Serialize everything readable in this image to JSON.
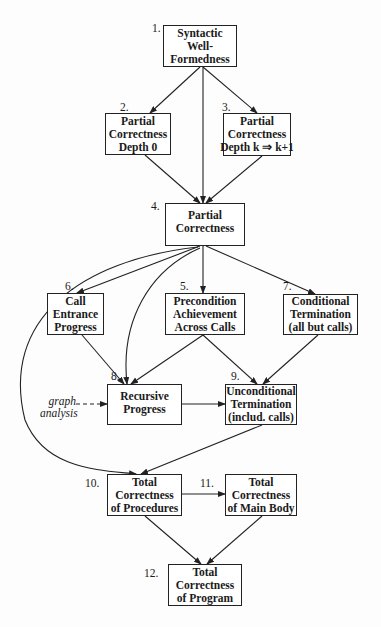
{
  "diagram": {
    "nodes": [
      {
        "id": 1,
        "number": "1.",
        "lines": [
          "Syntactic",
          "Well-",
          "Formedness"
        ]
      },
      {
        "id": 2,
        "number": "2.",
        "lines": [
          "Partial",
          "Correctness",
          "Depth 0"
        ]
      },
      {
        "id": 3,
        "number": "3.",
        "lines": [
          "Partial",
          "Correctness",
          "Depth k ⇒ k+1"
        ]
      },
      {
        "id": 4,
        "number": "4.",
        "lines": [
          "Partial",
          "Correctness"
        ]
      },
      {
        "id": 5,
        "number": "5.",
        "lines": [
          "Precondition",
          "Achievement",
          "Across Calls"
        ]
      },
      {
        "id": 6,
        "number": "6.",
        "lines": [
          "Call",
          "Entrance",
          "Progress"
        ]
      },
      {
        "id": 7,
        "number": "7.",
        "lines": [
          "Conditional",
          "Termination",
          "(all but calls)"
        ]
      },
      {
        "id": 8,
        "number": "8.",
        "lines": [
          "Recursive",
          "Progress"
        ]
      },
      {
        "id": 9,
        "number": "9.",
        "lines": [
          "Unconditional",
          "Termination",
          "(includ. calls)"
        ]
      },
      {
        "id": 10,
        "number": "10.",
        "lines": [
          "Total",
          "Correctness",
          "of Procedures"
        ]
      },
      {
        "id": 11,
        "number": "11.",
        "lines": [
          "Total",
          "Correctness",
          "of Main Body"
        ]
      },
      {
        "id": 12,
        "number": "12.",
        "lines": [
          "Total",
          "Correctness",
          "of Program"
        ]
      }
    ],
    "external_input": {
      "lines": [
        "graph",
        "analysis"
      ],
      "target": 8,
      "style": "dashed"
    },
    "edges": [
      [
        1,
        2
      ],
      [
        1,
        3
      ],
      [
        1,
        4
      ],
      [
        2,
        4
      ],
      [
        3,
        4
      ],
      [
        4,
        6
      ],
      [
        4,
        5
      ],
      [
        4,
        7
      ],
      [
        4,
        8
      ],
      [
        4,
        10
      ],
      [
        6,
        8
      ],
      [
        5,
        8
      ],
      [
        5,
        9
      ],
      [
        7,
        9
      ],
      [
        8,
        9
      ],
      [
        9,
        10
      ],
      [
        10,
        11
      ],
      [
        10,
        12
      ],
      [
        11,
        12
      ]
    ]
  }
}
